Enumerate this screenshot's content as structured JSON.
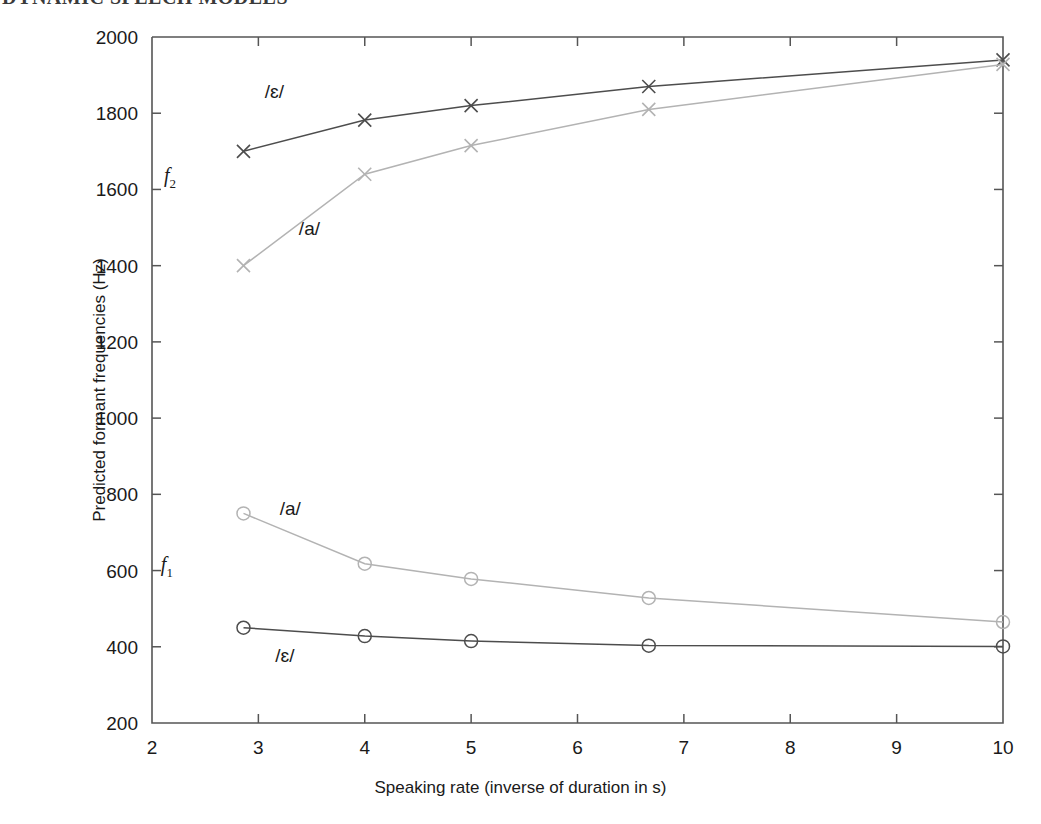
{
  "header": {
    "running_title": "DYNAMIC SPEECH MODELS"
  },
  "figure": {
    "series_labels": {
      "f2_group": "f2",
      "f1_group": "f1",
      "f2_eps": "/ɛ/",
      "f2_a": "/a/",
      "f1_a": "/a/",
      "f1_eps": "/ɛ/"
    },
    "colors": {
      "dark": "#4d4d4d",
      "light": "#b3b3b3",
      "axis": "#555555",
      "text": "#1a1a1a"
    }
  },
  "chart_data": {
    "type": "line",
    "title": "",
    "xlabel": "Speaking rate (inverse of duration in s)",
    "ylabel": "Predicted formant frequencies (Hz)",
    "xlim": [
      2,
      10
    ],
    "ylim": [
      200,
      2000
    ],
    "xticks": [
      2,
      3,
      4,
      5,
      6,
      7,
      8,
      9,
      10
    ],
    "yticks": [
      200,
      400,
      600,
      800,
      1000,
      1200,
      1400,
      1600,
      1800,
      2000
    ],
    "xtick_labels": [
      "2",
      "3",
      "4",
      "5",
      "6",
      "7",
      "8",
      "9",
      "10"
    ],
    "ytick_labels": [
      "200",
      "400",
      "600",
      "800",
      "1000",
      "1200",
      "1400",
      "1600",
      "1800",
      "2000"
    ],
    "grid": false,
    "legend": "none",
    "annotations": [
      {
        "text": "f2",
        "x": 2.17,
        "y": 1620,
        "note": "group label for second formant curves"
      },
      {
        "text": "f1",
        "x": 2.14,
        "y": 600,
        "note": "group label for first formant curves"
      },
      {
        "text": "/ɛ/",
        "x": 3.15,
        "y": 1840,
        "note": "labels upper dark f2 curve"
      },
      {
        "text": "/a/",
        "x": 3.48,
        "y": 1480,
        "note": "labels lower light f2 curve"
      },
      {
        "text": "/a/",
        "x": 3.3,
        "y": 745,
        "note": "labels upper light f1 curve"
      },
      {
        "text": "/ɛ/",
        "x": 3.25,
        "y": 360,
        "note": "labels lower dark f1 curve"
      }
    ],
    "x": [
      2.86,
      4.0,
      5.0,
      6.67,
      10.0
    ],
    "series": [
      {
        "name": "f2 /ɛ/",
        "formant": "f2",
        "vowel": "/ɛ/",
        "marker": "x",
        "color": "#4d4d4d",
        "values": [
          1700,
          1782,
          1820,
          1870,
          1940
        ]
      },
      {
        "name": "f2 /a/",
        "formant": "f2",
        "vowel": "/a/",
        "marker": "x",
        "color": "#b3b3b3",
        "values": [
          1400,
          1640,
          1715,
          1810,
          1928
        ]
      },
      {
        "name": "f1 /a/",
        "formant": "f1",
        "vowel": "/a/",
        "marker": "o",
        "color": "#b3b3b3",
        "values": [
          750,
          618,
          578,
          528,
          465
        ]
      },
      {
        "name": "f1 /ɛ/",
        "formant": "f1",
        "vowel": "/ɛ/",
        "marker": "o",
        "color": "#4d4d4d",
        "values": [
          450,
          428,
          415,
          403,
          401
        ]
      }
    ]
  }
}
